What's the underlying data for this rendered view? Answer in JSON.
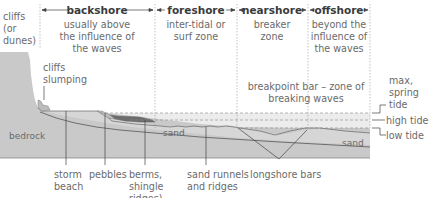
{
  "zones": [
    {
      "id": "backshore",
      "title": "backshore",
      "description": [
        "usually above",
        "the influence of",
        "the waves"
      ]
    },
    {
      "id": "foreshore",
      "title": "foreshore",
      "description": [
        "inter-tidal or",
        "surf zone"
      ]
    },
    {
      "id": "nearshore",
      "title": "nearshore",
      "description": [
        "breaker",
        "zone"
      ]
    },
    {
      "id": "offshore",
      "title": "offshore",
      "description": [
        "beyond the",
        "influence of",
        "the waves"
      ]
    }
  ],
  "left_label": [
    "cliffs",
    "(or",
    "dunes)"
  ],
  "cliff_label": [
    "cliffs",
    "slumping"
  ],
  "inner_labels": {
    "bedrock": "bedrock",
    "sand_near": "sand",
    "sand_far": "sand",
    "breakpoint": [
      "breakpoint bar – zone of",
      "breaking waves"
    ]
  },
  "tide_labels": {
    "max_spring": [
      "max,",
      "spring",
      "tide"
    ],
    "high": "high tide",
    "low": "low tide"
  },
  "bottom_labels": [
    {
      "id": "storm-beach",
      "lines": [
        "storm",
        "beach"
      ]
    },
    {
      "id": "pebbles",
      "lines": [
        "pebbles"
      ]
    },
    {
      "id": "berms",
      "lines": [
        "berms,",
        "shingle",
        "ridges)"
      ]
    },
    {
      "id": "sand-runnels",
      "lines": [
        "sand runnels",
        "and ridges"
      ]
    },
    {
      "id": "longshore-bars",
      "lines": [
        "longshore bars"
      ]
    }
  ],
  "colors": {
    "bedrock": "#c8c8c8",
    "sand": "#d9d9d9",
    "water": "#ebebeb",
    "shingle": "#6e6e6e",
    "line": "#555555",
    "text": "#6a6a6a",
    "header": "#3a3a3a"
  }
}
